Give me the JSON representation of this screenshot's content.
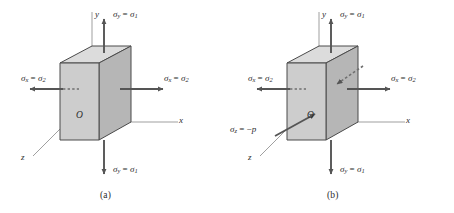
{
  "figure": {
    "background": "#ffffff",
    "ink": "#3a3a3a",
    "face_front": "#cfcfcf",
    "face_right": "#b4b4b4",
    "face_top": "#dedede",
    "arrow_color": "#555555"
  },
  "panels": [
    {
      "id": "a",
      "caption": "(a)",
      "axes": {
        "y": "y",
        "x": "x",
        "z": "z",
        "origin": "O"
      },
      "labels": {
        "sigma_y_top": {
          "symbol": "σ",
          "sub": "y",
          "rel": " = ",
          "symbol2": "σ",
          "sub2": "1",
          "text": "σy = σ1"
        },
        "sigma_y_bottom": {
          "symbol": "σ",
          "sub": "y",
          "rel": " = ",
          "symbol2": "σ",
          "sub2": "1",
          "text": "σy = σ1"
        },
        "sigma_x_left": {
          "symbol": "σ",
          "sub": "x",
          "rel": " = ",
          "symbol2": "σ",
          "sub2": "2",
          "text": "σx = σ2"
        },
        "sigma_x_right": {
          "symbol": "σ",
          "sub": "x",
          "rel": " = ",
          "symbol2": "σ",
          "sub2": "2",
          "text": "σx = σ2"
        }
      }
    },
    {
      "id": "b",
      "caption": "(b)",
      "axes": {
        "y": "y",
        "x": "x",
        "z": "z",
        "origin": "O"
      },
      "labels": {
        "sigma_y_top": {
          "symbol": "σ",
          "sub": "y",
          "rel": " = ",
          "symbol2": "σ",
          "sub2": "1",
          "text": "σy = σ1"
        },
        "sigma_y_bottom": {
          "symbol": "σ",
          "sub": "y",
          "rel": " = ",
          "symbol2": "σ",
          "sub2": "1",
          "text": "σy = σ1"
        },
        "sigma_x_left": {
          "symbol": "σ",
          "sub": "x",
          "rel": " = ",
          "symbol2": "σ",
          "sub2": "2",
          "text": "σx = σ2"
        },
        "sigma_x_right": {
          "symbol": "σ",
          "sub": "x",
          "rel": " = ",
          "symbol2": "σ",
          "sub2": "2",
          "text": "σx = σ2"
        },
        "sigma_z": {
          "symbol": "σ",
          "sub": "z",
          "rel": " = −",
          "symbol2": "p",
          "sub2": "",
          "text": "σz = −p"
        }
      }
    }
  ],
  "glyphs": {
    "sigma": "σ",
    "equals": "=",
    "minus": "−"
  }
}
